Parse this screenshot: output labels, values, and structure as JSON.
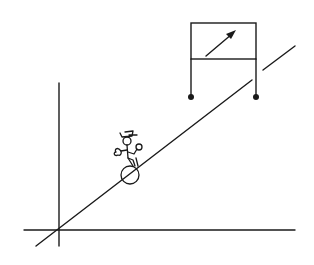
{
  "diagram": {
    "colors": {
      "stroke": "#1a1a1a",
      "background": "#ffffff"
    },
    "elements": [
      "vertical-axis",
      "horizontal-axis",
      "incline-line",
      "unicyclist-figure",
      "meter-box",
      "meter-needle-arrow",
      "meter-terminals"
    ]
  }
}
